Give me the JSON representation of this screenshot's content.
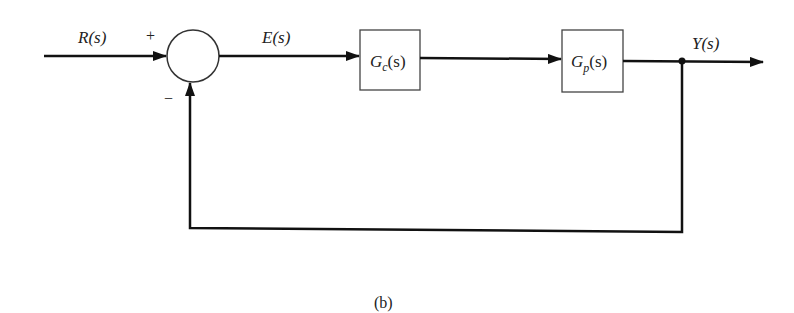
{
  "diagram": {
    "type": "block-diagram",
    "input": {
      "label": "R(s)"
    },
    "summing_junction": {
      "plus_sign": "+",
      "minus_sign": "−"
    },
    "error_signal": {
      "label": "E(s)"
    },
    "controller": {
      "name": "G",
      "sub": "c",
      "arg": "(s)"
    },
    "plant": {
      "name": "G",
      "sub": "p",
      "arg": "(s)"
    },
    "output": {
      "label": "Y(s)"
    },
    "feedback": "unity negative feedback",
    "caption": "(b)"
  }
}
